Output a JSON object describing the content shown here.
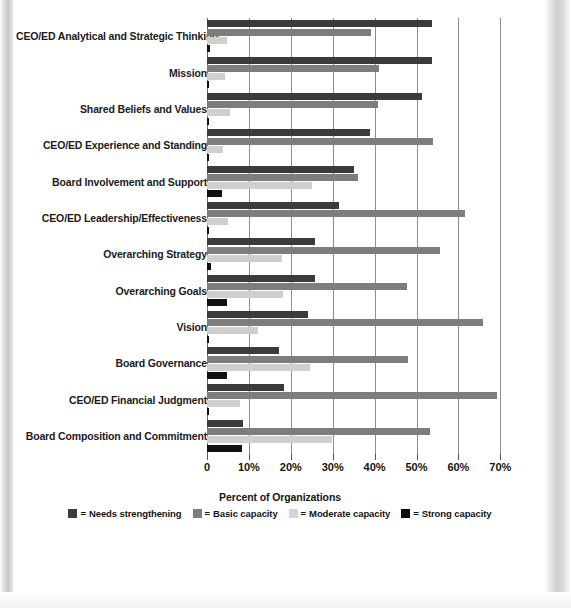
{
  "chart_data": {
    "type": "bar",
    "orientation": "horizontal",
    "title": "",
    "xlabel": "Percent of Organizations",
    "ylabel": "",
    "xlim": [
      0,
      72
    ],
    "grid": true,
    "legend_position": "bottom",
    "xticks": [
      0,
      10,
      20,
      30,
      40,
      50,
      60,
      70
    ],
    "xtick_labels": [
      "0",
      "10%",
      "20%",
      "30%",
      "40%",
      "50%",
      "60%",
      "70%"
    ],
    "categories": [
      "CEO/ED Analytical and Strategic Thinking",
      "Mission",
      "Shared Beliefs and Values",
      "CEO/ED Experience and Standing",
      "Board Involvement and Support",
      "CEO/ED Leadership/Effectiveness",
      "Overarching Strategy",
      "Overarching Goals",
      "Vision",
      "Board Governance",
      "CEO/ED Financial Judgment",
      "Board Composition and Commitment"
    ],
    "series": [
      {
        "name": "Needs strengthening",
        "color": "#3b3b3b",
        "values": [
          53.7,
          53.7,
          51.3,
          38.9,
          35.1,
          31.6,
          25.8,
          25.8,
          24.2,
          17.3,
          18.4,
          8.6
        ]
      },
      {
        "name": "Basic capacity",
        "color": "#7d7d7d",
        "values": [
          39.1,
          41.0,
          40.8,
          54.0,
          36.0,
          61.6,
          55.6,
          47.7,
          65.9,
          48.0,
          69.2,
          53.2
        ]
      },
      {
        "name": "Moderate capacity",
        "color": "#cfcfcf",
        "values": [
          4.8,
          4.2,
          5.5,
          3.8,
          25.1,
          5.0,
          17.9,
          18.1,
          12.2,
          24.6,
          7.9,
          29.8
        ]
      },
      {
        "name": "Strong capacity",
        "color": "#111111",
        "values": [
          0.6,
          0.5,
          0.5,
          0.5,
          3.5,
          0.5,
          1.0,
          4.7,
          0.5,
          4.7,
          0.5,
          8.3
        ]
      }
    ]
  },
  "legend": {
    "equals": "=",
    "entries": [
      "Needs strengthening",
      "Basic capacity",
      "Moderate capacity",
      "Strong capacity"
    ]
  }
}
